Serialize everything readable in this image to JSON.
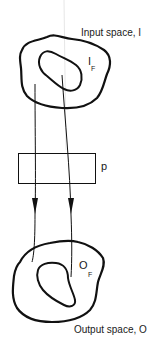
{
  "diagram": {
    "input_space": {
      "label": "Input space, I",
      "subset_symbol": "I",
      "subset_subscript": "F"
    },
    "process": {
      "label": "p"
    },
    "output_space": {
      "label": "Output space, O",
      "subset_symbol": "O",
      "subset_subscript": "F"
    },
    "mappings": [
      {
        "from": "input-space-outer-region",
        "to": "output-space-outer-region"
      },
      {
        "from": "input-failure-region",
        "to": "output-failure-region"
      }
    ],
    "colors": {
      "stroke": "#111111",
      "background": "#ffffff"
    }
  }
}
